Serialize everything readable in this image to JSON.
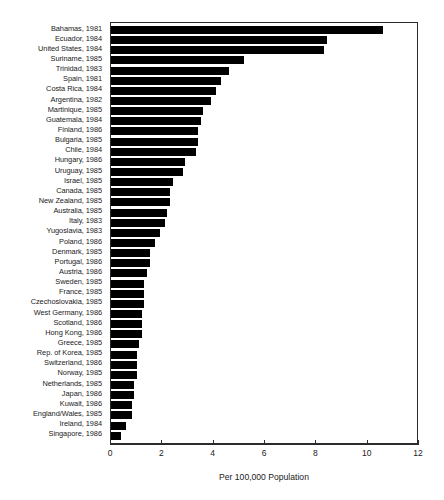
{
  "chart_data": {
    "type": "bar",
    "orientation": "horizontal",
    "title": "",
    "subtitle": "",
    "xlabel": "Per 100,000 Population",
    "ylabel": "",
    "xlim": [
      0,
      12
    ],
    "xticks": [
      0,
      2,
      4,
      6,
      8,
      10,
      12
    ],
    "xtick_labels": [
      "0",
      "2",
      "4",
      "6",
      "8",
      "10",
      "12"
    ],
    "grid": false,
    "legend": null,
    "bar_color": "#000000",
    "frame_color": "#2b2b2b",
    "background": "#ffffff",
    "categories": [
      "Bahamas, 1981",
      "Ecuador, 1984",
      "United States, 1984",
      "Suriname, 1985",
      "Trinidad, 1983",
      "Spain, 1981",
      "Costa Rica, 1984",
      "Argentina, 1982",
      "Martinique, 1985",
      "Guatemala, 1984",
      "Finland, 1986",
      "Bulgaria, 1985",
      "Chile, 1984",
      "Hungary, 1986",
      "Uruguay, 1985",
      "Israel, 1985",
      "Canada, 1985",
      "New Zealand, 1985",
      "Australia, 1985",
      "Italy, 1983",
      "Yugoslavia, 1983",
      "Poland, 1986",
      "Denmark, 1985",
      "Portugal, 1986",
      "Austria, 1986",
      "Sweden, 1985",
      "France, 1985",
      "Czechoslovakia, 1985",
      "West Germany, 1986",
      "Scotland, 1986",
      "Hong Kong, 1986",
      "Greece, 1985",
      "Rep. of Korea, 1985",
      "Switzerland, 1986",
      "Norway, 1985",
      "Netherlands, 1985",
      "Japan, 1986",
      "Kuwait, 1986",
      "England/Wales, 1985",
      "Ireland, 1984",
      "Singapore, 1986"
    ],
    "values": [
      10.6,
      8.4,
      8.3,
      5.2,
      4.6,
      4.3,
      4.1,
      3.9,
      3.6,
      3.5,
      3.4,
      3.4,
      3.3,
      2.9,
      2.8,
      2.4,
      2.3,
      2.3,
      2.2,
      2.1,
      1.9,
      1.7,
      1.5,
      1.5,
      1.4,
      1.3,
      1.3,
      1.3,
      1.2,
      1.2,
      1.2,
      1.1,
      1.0,
      1.0,
      1.0,
      0.9,
      0.9,
      0.8,
      0.8,
      0.6,
      0.4
    ]
  }
}
